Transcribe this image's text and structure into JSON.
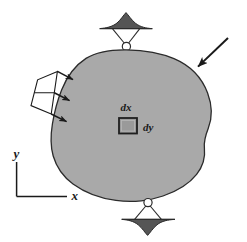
{
  "figure": {
    "name": "deformable-body-free-body-diagram",
    "background_color": "#ffffff",
    "width": 247,
    "height": 242
  },
  "body": {
    "label": "deformable-body",
    "fill_color": "#a9a9a9",
    "stroke_color": "#2b2b2b"
  },
  "differential_element": {
    "square_fill": "#9a9a9a",
    "square_stroke": "#1f1f1f",
    "dx_label": "dx",
    "dy_label": "dy"
  },
  "axes": {
    "x_label": "x",
    "y_label": "y",
    "stroke_color": "#1a1a1a"
  },
  "supports": {
    "top": {
      "name": "pin-support-top",
      "ground_fill": "#555555",
      "pin_fill": "#ffffff",
      "stroke_color": "#1f1f1f"
    },
    "bottom": {
      "name": "pin-support-bottom",
      "ground_fill": "#555555",
      "pin_fill": "#ffffff",
      "stroke_color": "#1f1f1f"
    }
  },
  "loads": {
    "distributed": {
      "name": "distributed-load-left",
      "arrow_count": 3,
      "stroke_color": "#1a1a1a",
      "fill_color": "#ffffff"
    },
    "concentrated": {
      "name": "concentrated-load-upper-right",
      "stroke_color": "#1a1a1a"
    }
  }
}
